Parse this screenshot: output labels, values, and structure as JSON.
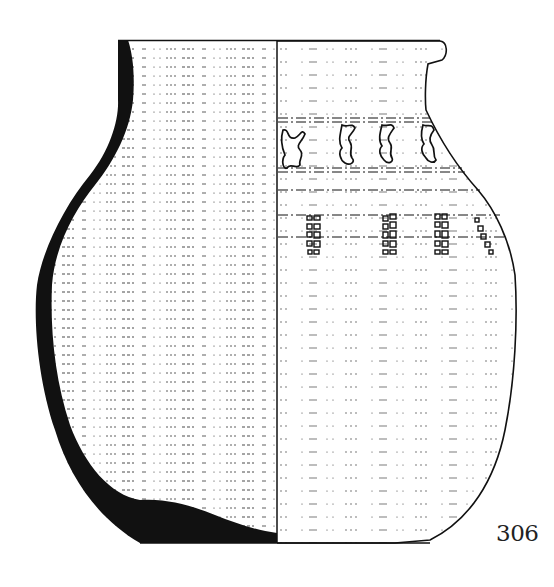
{
  "figure": {
    "type": "archaeological pottery drawing",
    "catalog_number": "306",
    "colors": {
      "ink": "#111111",
      "paper": "#ffffff",
      "label": "#222222"
    },
    "views": {
      "left": "section",
      "right": "exterior"
    },
    "decoration": {
      "upper_band": {
        "motif": "stylized anthropomorphic / zigzag figures",
        "count_visible": 4
      },
      "lower_band": {
        "motif": "ladder columns of small rectangular stamps",
        "count_visible": 4
      }
    }
  }
}
